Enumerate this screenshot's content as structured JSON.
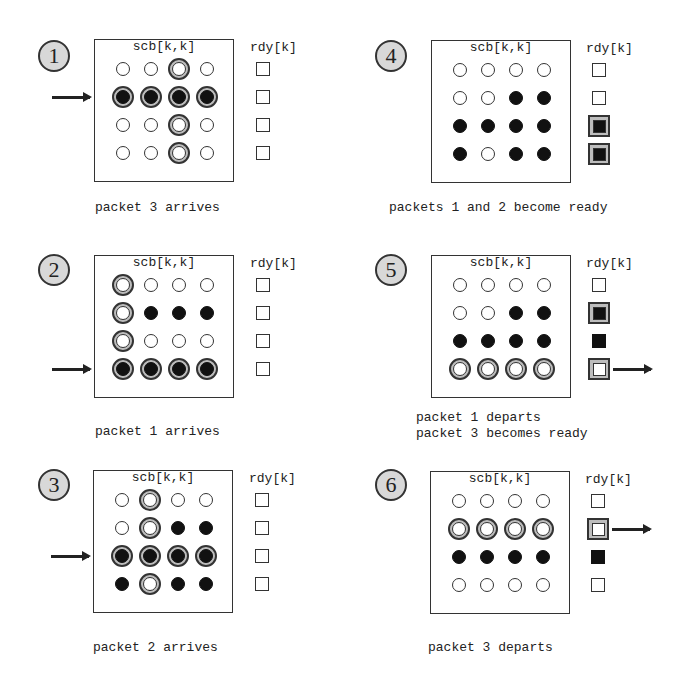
{
  "legend": {
    "matrix_label": "scb[k,k]",
    "ready_label": "rdy[k]"
  },
  "cell_states": {
    "empty": "open circle",
    "set": "filled circle",
    "changed": "ringed (grey halo) circle"
  },
  "panels": [
    {
      "step": "1",
      "caption": "packet 3 arrives",
      "input_arrow_row": 1,
      "output_arrow_row": null,
      "matrix": [
        [
          "empty",
          "empty",
          "ring-empty",
          "empty"
        ],
        [
          "ring-filled",
          "ring-filled",
          "ring-filled",
          "ring-filled"
        ],
        [
          "empty",
          "empty",
          "ring-empty",
          "empty"
        ],
        [
          "empty",
          "empty",
          "ring-empty",
          "empty"
        ]
      ],
      "rdy": [
        "empty",
        "empty",
        "empty",
        "empty"
      ]
    },
    {
      "step": "2",
      "caption": "packet 1 arrives",
      "input_arrow_row": 3,
      "output_arrow_row": null,
      "matrix": [
        [
          "ring-empty",
          "empty",
          "empty",
          "empty"
        ],
        [
          "ring-empty",
          "filled",
          "filled",
          "filled"
        ],
        [
          "ring-empty",
          "empty",
          "empty",
          "empty"
        ],
        [
          "ring-filled",
          "ring-filled",
          "ring-filled",
          "ring-filled"
        ]
      ],
      "rdy": [
        "empty",
        "empty",
        "empty",
        "empty"
      ]
    },
    {
      "step": "3",
      "caption": "packet 2 arrives",
      "input_arrow_row": 2,
      "output_arrow_row": null,
      "matrix": [
        [
          "empty",
          "ring-empty",
          "empty",
          "empty"
        ],
        [
          "empty",
          "ring-empty",
          "filled",
          "filled"
        ],
        [
          "ring-filled",
          "ring-filled",
          "ring-filled",
          "ring-filled"
        ],
        [
          "filled",
          "ring-empty",
          "filled",
          "filled"
        ]
      ],
      "rdy": [
        "empty",
        "empty",
        "empty",
        "empty"
      ]
    },
    {
      "step": "4",
      "caption": "packets 1 and 2 become ready",
      "input_arrow_row": null,
      "output_arrow_row": null,
      "matrix": [
        [
          "empty",
          "empty",
          "empty",
          "empty"
        ],
        [
          "empty",
          "empty",
          "filled",
          "filled"
        ],
        [
          "filled",
          "filled",
          "filled",
          "filled"
        ],
        [
          "filled",
          "empty",
          "filled",
          "filled"
        ]
      ],
      "rdy": [
        "empty",
        "empty",
        "ring-filled",
        "ring-filled"
      ]
    },
    {
      "step": "5",
      "caption": "packet 1 departs\npacket 3 becomes ready",
      "input_arrow_row": null,
      "output_arrow_row": 3,
      "matrix": [
        [
          "empty",
          "empty",
          "empty",
          "empty"
        ],
        [
          "empty",
          "empty",
          "filled",
          "filled"
        ],
        [
          "filled",
          "filled",
          "filled",
          "filled"
        ],
        [
          "ring-empty",
          "ring-empty",
          "ring-empty",
          "ring-empty"
        ]
      ],
      "rdy": [
        "empty",
        "ring-filled",
        "filled",
        "ring-empty"
      ]
    },
    {
      "step": "6",
      "caption": "packet 3 departs",
      "input_arrow_row": null,
      "output_arrow_row": 1,
      "matrix": [
        [
          "empty",
          "empty",
          "empty",
          "empty"
        ],
        [
          "ring-empty",
          "ring-empty",
          "ring-empty",
          "ring-empty"
        ],
        [
          "filled",
          "filled",
          "filled",
          "filled"
        ],
        [
          "empty",
          "empty",
          "empty",
          "empty"
        ]
      ],
      "rdy": [
        "empty",
        "ring-empty",
        "filled",
        "empty"
      ]
    }
  ]
}
